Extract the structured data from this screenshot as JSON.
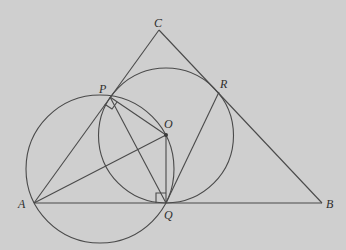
{
  "diagram": {
    "type": "geometry",
    "background_color": "#cfcfcf",
    "line_color": "#4a4a4a",
    "points": {
      "A": {
        "label": "A",
        "x": 34,
        "y": 203
      },
      "B": {
        "label": "B",
        "x": 322,
        "y": 203
      },
      "C": {
        "label": "C",
        "x": 159,
        "y": 30
      },
      "P": {
        "label": "P",
        "x": 110,
        "y": 97
      },
      "Q": {
        "label": "Q",
        "x": 166,
        "y": 203
      },
      "R": {
        "label": "R",
        "x": 219,
        "y": 92
      },
      "O": {
        "label": "O",
        "x": 166,
        "y": 135
      }
    },
    "segments": [
      [
        "A",
        "B"
      ],
      [
        "B",
        "C"
      ],
      [
        "C",
        "A"
      ],
      [
        "A",
        "O"
      ],
      [
        "P",
        "O"
      ],
      [
        "P",
        "Q"
      ],
      [
        "O",
        "Q"
      ],
      [
        "Q",
        "R"
      ]
    ],
    "circles": [
      {
        "name": "circle-APOQ",
        "cx": 100,
        "cy": 169,
        "r": 74
      },
      {
        "name": "incircle-PQR",
        "center": "O",
        "cx": 166,
        "cy": 135.5,
        "r": 67.5
      }
    ],
    "right_angles": [
      "P",
      "Q"
    ]
  },
  "labels": {
    "A": "A",
    "B": "B",
    "C": "C",
    "P": "P",
    "Q": "Q",
    "R": "R",
    "O": "O"
  }
}
